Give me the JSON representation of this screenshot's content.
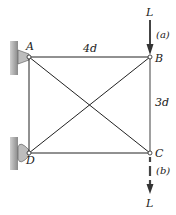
{
  "diagram": {
    "type": "truss",
    "nodes": [
      {
        "id": "A",
        "label": "A",
        "support": "pin-wall"
      },
      {
        "id": "B",
        "label": "B"
      },
      {
        "id": "C",
        "label": "C"
      },
      {
        "id": "D",
        "label": "D",
        "support": "pin-wall"
      }
    ],
    "members": [
      [
        "A",
        "B"
      ],
      [
        "B",
        "C"
      ],
      [
        "C",
        "D"
      ],
      [
        "D",
        "A"
      ],
      [
        "A",
        "C"
      ],
      [
        "B",
        "D"
      ]
    ],
    "dimensions": {
      "horizontal": "4d",
      "vertical": "3d"
    },
    "loads": [
      {
        "case": "(a)",
        "node": "B",
        "label": "L",
        "direction": "down",
        "style": "solid"
      },
      {
        "case": "(b)",
        "node": "C",
        "label": "L",
        "direction": "down",
        "style": "dashed"
      }
    ],
    "colors": {
      "line": "#222222",
      "wall": "#9a9a9a",
      "bracket": "#b8b8b8"
    }
  }
}
